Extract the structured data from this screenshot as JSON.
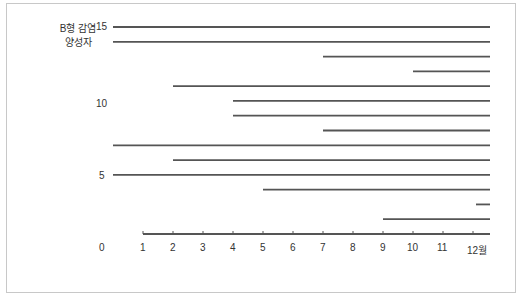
{
  "chart_data": {
    "type": "line",
    "title": "",
    "ylabel": "B형 감염 양성자",
    "xlabel": "월",
    "y_ticks": [
      "15",
      "10",
      "5",
      "0"
    ],
    "x_ticks": [
      "1",
      "2",
      "3",
      "4",
      "5",
      "6",
      "7",
      "8",
      "9",
      "10",
      "11",
      "12월"
    ],
    "ylim": [
      0,
      15
    ],
    "xlim": [
      0,
      12.6
    ],
    "grid": false,
    "legend": null,
    "series": [
      {
        "name": "case-15",
        "y": 15,
        "start": 0.0,
        "end": 12.6
      },
      {
        "name": "case-14",
        "y": 14,
        "start": 0.0,
        "end": 12.6
      },
      {
        "name": "case-13",
        "y": 13,
        "start": 7.0,
        "end": 12.6
      },
      {
        "name": "case-12",
        "y": 12,
        "start": 10.0,
        "end": 12.6
      },
      {
        "name": "case-11",
        "y": 11,
        "start": 2.0,
        "end": 12.6
      },
      {
        "name": "case-10",
        "y": 10,
        "start": 4.0,
        "end": 12.6
      },
      {
        "name": "case-9",
        "y": 9,
        "start": 4.0,
        "end": 12.6
      },
      {
        "name": "case-8",
        "y": 8,
        "start": 7.0,
        "end": 12.6
      },
      {
        "name": "case-7",
        "y": 7,
        "start": 0.0,
        "end": 12.6
      },
      {
        "name": "case-6",
        "y": 6,
        "start": 2.0,
        "end": 12.6
      },
      {
        "name": "case-5",
        "y": 5,
        "start": 0.0,
        "end": 12.6
      },
      {
        "name": "case-4",
        "y": 4,
        "start": 5.0,
        "end": 12.6
      },
      {
        "name": "case-3",
        "y": 3,
        "start": 12.1,
        "end": 12.6
      },
      {
        "name": "case-2",
        "y": 2,
        "start": 9.0,
        "end": 12.6
      },
      {
        "name": "case-1",
        "y": 1,
        "start": 1.0,
        "end": 12.6
      }
    ]
  },
  "labels": {
    "ylabel_line1": "B형 감염",
    "ylabel_line2": "양성자"
  }
}
